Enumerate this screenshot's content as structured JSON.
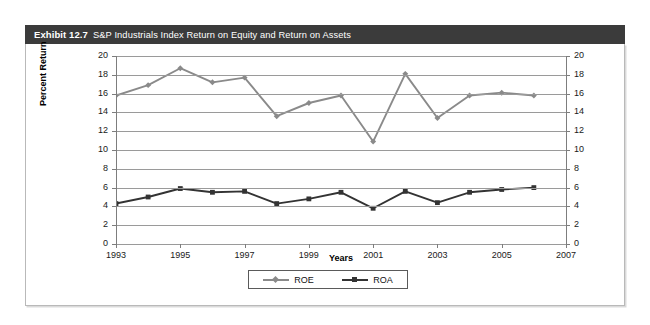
{
  "exhibit": {
    "number": "Exhibit 12.7",
    "caption": "S&P Industrials Index Return on Equity and Return on Assets",
    "header_bg": "#3b3b3b",
    "header_fg": "#ffffff"
  },
  "chart_data": {
    "type": "line",
    "title": "S&P Industrials Index Return on Equity and Return on Assets",
    "xlabel": "Years",
    "ylabel": "Percent Return",
    "x": [
      1993,
      1994,
      1995,
      1996,
      1997,
      1998,
      1999,
      2000,
      2001,
      2002,
      2003,
      2004,
      2005,
      2006
    ],
    "xlim": [
      1993,
      2007
    ],
    "ylim": [
      0,
      20
    ],
    "xticks": [
      1993,
      1995,
      1997,
      1999,
      2001,
      2003,
      2005,
      2007
    ],
    "xticklabels": [
      "1993",
      "1995",
      "1997",
      "1999",
      "2001",
      "2003",
      "2005",
      "2007"
    ],
    "yticks": [
      0,
      2,
      4,
      6,
      8,
      10,
      12,
      14,
      16,
      18,
      20
    ],
    "yticklabels": [
      "0",
      "2",
      "4",
      "6",
      "8",
      "10",
      "12",
      "14",
      "16",
      "18",
      "20"
    ],
    "right_axis_ticklabels": [
      "0",
      "2",
      "4",
      "6",
      "8",
      "10",
      "12",
      "14",
      "16",
      "18",
      "20"
    ],
    "grid": true,
    "grid_axis": "y",
    "legend_position": "bottom-center",
    "series": [
      {
        "name": "ROE",
        "color": "#8a8a8a",
        "marker": "diamond",
        "values": [
          15.8,
          16.9,
          18.7,
          17.2,
          17.7,
          13.6,
          15.0,
          15.8,
          10.9,
          18.1,
          13.4,
          15.8,
          16.1,
          15.8
        ]
      },
      {
        "name": "ROA",
        "color": "#333333",
        "marker": "square",
        "values": [
          4.3,
          5.0,
          5.9,
          5.5,
          5.6,
          4.3,
          4.8,
          5.5,
          3.8,
          5.6,
          4.4,
          5.5,
          5.8,
          6.0
        ]
      }
    ]
  }
}
